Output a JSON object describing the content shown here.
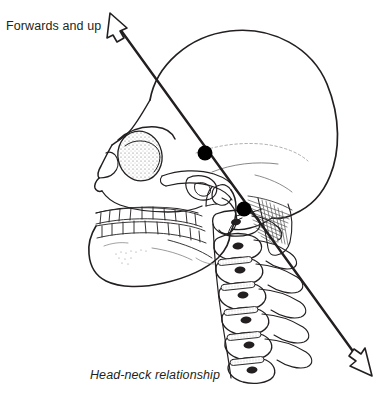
{
  "figure": {
    "title": "Head-neck relationship",
    "caption": "Head-neck relationship",
    "background_color": "#ffffff",
    "ink_color": "#231f20",
    "width": 383,
    "height": 394
  },
  "annotations": {
    "direction_label": "Forwards and up"
  },
  "diagram": {
    "type": "anatomical-line-drawing",
    "view": "lateral",
    "axis_line": {
      "name": "head-neck direction axis",
      "style": "double-headed open arrow",
      "start": [
        112,
        18
      ],
      "end": [
        368,
        372
      ],
      "stroke_color": "#231f20",
      "stroke_width": 2.4
    },
    "marker_points": [
      {
        "name": "atlanto-occipital-joint-dot",
        "x": 205,
        "y": 153,
        "r": 7.5,
        "fill": "#000000"
      },
      {
        "name": "odontoid-peg-dot",
        "x": 244,
        "y": 209,
        "r": 7.5,
        "fill": "#000000"
      }
    ],
    "parts": [
      "cranial vault",
      "frontal bone",
      "orbit",
      "nasal aperture",
      "zygomatic arch",
      "maxilla with upper dentition",
      "mandible with lower dentition",
      "external auditory meatus",
      "mastoid process",
      "occipital bone",
      "cervical vertebrae C1-C7",
      "intervertebral discs"
    ]
  }
}
